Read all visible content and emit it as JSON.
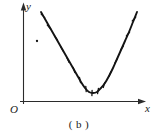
{
  "figure": {
    "caption": "( b )",
    "axis_labels": {
      "x": "x",
      "y": "y",
      "origin": "O"
    },
    "colors": {
      "ink": "#1a1a1a",
      "background": "#ffffff",
      "curve": "#141414",
      "axis": "#2b2b2b"
    }
  },
  "chart_data": {
    "type": "scatter",
    "title": "",
    "subtitle": "",
    "xlabel": "x",
    "ylabel": "y",
    "origin_label": "O",
    "caption": "( b )",
    "grid": false,
    "legend": null,
    "axis_style": "arrowed-cartesian",
    "xlim": [
      0,
      1
    ],
    "ylim": [
      0,
      1
    ],
    "fit_curve": {
      "shape": "parabola",
      "vertex_px": [
        90,
        93
      ],
      "points_px": [
        [
          41,
          12
        ],
        [
          45,
          19
        ],
        [
          49,
          26
        ],
        [
          53,
          33
        ],
        [
          57,
          40
        ],
        [
          61,
          47
        ],
        [
          65,
          54
        ],
        [
          69,
          61
        ],
        [
          73,
          68
        ],
        [
          77,
          75
        ],
        [
          81,
          82
        ],
        [
          85,
          88
        ],
        [
          89,
          92
        ],
        [
          93,
          93
        ],
        [
          97,
          92
        ],
        [
          101,
          88
        ],
        [
          105,
          83
        ],
        [
          109,
          76
        ],
        [
          113,
          68
        ],
        [
          117,
          59
        ],
        [
          121,
          50
        ],
        [
          125,
          41
        ],
        [
          129,
          32
        ],
        [
          133,
          22
        ],
        [
          137,
          12
        ]
      ]
    },
    "data_points_px": [
      [
        43,
        16
      ],
      [
        49,
        27
      ],
      [
        56,
        38
      ],
      [
        62,
        49
      ],
      [
        68,
        60
      ],
      [
        74,
        70
      ],
      [
        80,
        80
      ],
      [
        86,
        89
      ],
      [
        92,
        93
      ],
      [
        98,
        91
      ],
      [
        104,
        85
      ],
      [
        110,
        74
      ],
      [
        116,
        61
      ],
      [
        122,
        48
      ],
      [
        128,
        34
      ],
      [
        134,
        19
      ]
    ],
    "outlier_points_px": [
      [
        37,
        41
      ]
    ],
    "series": [
      {
        "name": "observed data",
        "marker": "tick",
        "n_points": 16
      },
      {
        "name": "fitted curve",
        "marker": "line",
        "n_points": 25
      }
    ]
  }
}
